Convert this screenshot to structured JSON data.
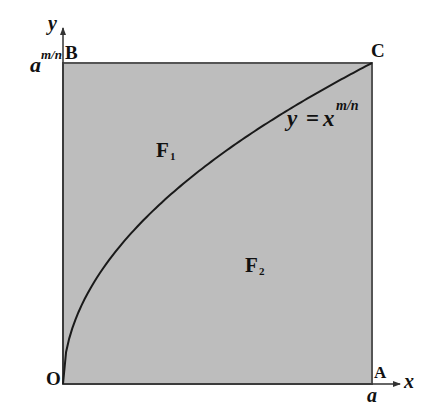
{
  "diagram": {
    "axes": {
      "x_label": "x",
      "y_label": "y"
    },
    "points": {
      "origin": "O",
      "A": "A",
      "B": "B",
      "C": "C"
    },
    "tick_labels": {
      "x_tick": "a",
      "y_tick_base": "a",
      "y_tick_exp": "m/n"
    },
    "curve_label": {
      "lhs": "y",
      "eq": "=",
      "base": "x",
      "exp": "m/n"
    },
    "regions": {
      "F1": {
        "letter": "F",
        "sub": "1"
      },
      "F2": {
        "letter": "F",
        "sub": "2"
      }
    },
    "colors": {
      "fill": "#bdbdbd",
      "curve": "#1a1a1a",
      "border": "#555555",
      "axis": "#333333"
    }
  }
}
